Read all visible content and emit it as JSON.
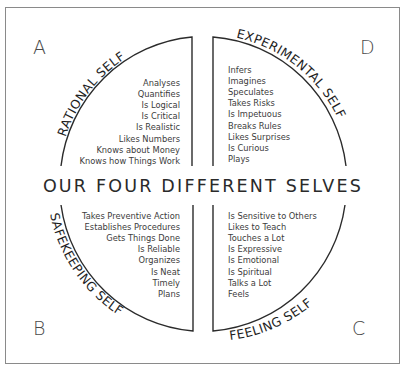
{
  "title": "OUR FOUR DIFFERENT SELVES",
  "quadrants": {
    "A": {
      "letter": "A",
      "label": "RATIONAL SELF",
      "items": [
        "Analyses",
        "Quantifies",
        "Is Logical",
        "Is Critical",
        "Is Realistic",
        "Likes Numbers",
        "Knows about Money",
        "Knows how Things Work"
      ]
    },
    "D": {
      "letter": "D",
      "label": "EXPERIMENTAL SELF",
      "items": [
        "Infers",
        "Imagines",
        "Speculates",
        "Takes Risks",
        "Is Impetuous",
        "Breaks Rules",
        "Likes Surprises",
        "Is Curious",
        "Plays"
      ]
    },
    "B": {
      "letter": "B",
      "label": "SAFEKEEPING SELF",
      "items": [
        "Takes Preventive Action",
        "Establishes Procedures",
        "Gets Things Done",
        "Is Reliable",
        "Organizes",
        "Is Neat",
        "Timely",
        "Plans"
      ]
    },
    "C": {
      "letter": "C",
      "label": "FEELING SELF",
      "items": [
        "Is Sensitive to Others",
        "Likes to Teach",
        "Touches a Lot",
        "Is Expressive",
        "Is Emotional",
        "Is Spiritual",
        "Talks a Lot",
        "Feels"
      ]
    }
  }
}
